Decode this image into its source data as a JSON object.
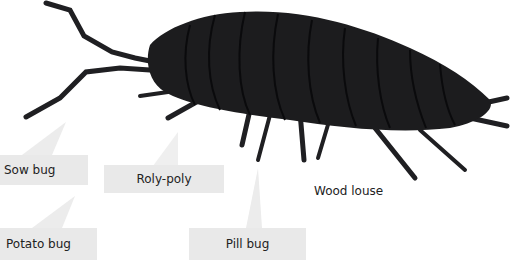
{
  "figure": {
    "labels": [
      {
        "id": "sow-bug",
        "text": "Sow bug"
      },
      {
        "id": "roly-poly",
        "text": "Roly-poly"
      },
      {
        "id": "wood-louse",
        "text": "Wood louse"
      },
      {
        "id": "potato-bug",
        "text": "Potato bug"
      },
      {
        "id": "pill-bug",
        "text": "Pill bug"
      }
    ],
    "colors": {
      "callout_bg": "#e9e9e9",
      "insect": "#1c1c1e",
      "text": "#222222"
    }
  }
}
